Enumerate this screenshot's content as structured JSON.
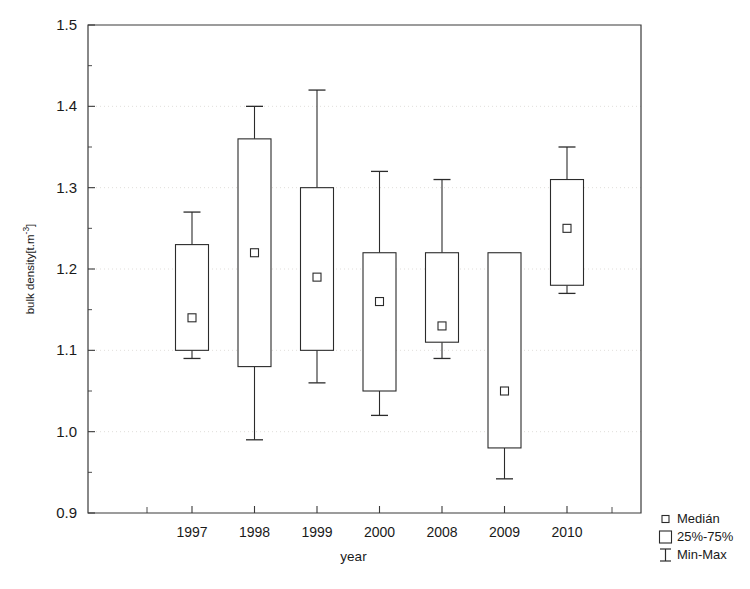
{
  "chart_data": {
    "type": "box",
    "title": "",
    "xlabel": "year",
    "ylabel": "bulk density[t.m-3]",
    "ylabel_base": "bulk density[t.m",
    "ylabel_sup": "-3",
    "ylabel_tail": "]",
    "categories": [
      "1997",
      "1998",
      "1999",
      "2000",
      "2008",
      "2009",
      "2010"
    ],
    "ylim": [
      0.9,
      1.5
    ],
    "ytick_labels": [
      "1.5",
      "1.4",
      "1.3",
      "1.2",
      "1.1",
      "1.0",
      "0.9"
    ],
    "ytick_values": [
      1.5,
      1.4,
      1.3,
      1.2,
      1.1,
      1.0,
      0.9
    ],
    "grid": true,
    "grid_axis": "y",
    "legend_position": "bottom-right-outside",
    "boxes": [
      {
        "category": "1997",
        "min": 1.09,
        "q1": 1.1,
        "median": 1.14,
        "q3": 1.23,
        "max": 1.27
      },
      {
        "category": "1998",
        "min": 0.99,
        "q1": 1.08,
        "median": 1.22,
        "q3": 1.36,
        "max": 1.4
      },
      {
        "category": "1999",
        "min": 1.06,
        "q1": 1.1,
        "median": 1.19,
        "q3": 1.3,
        "max": 1.42
      },
      {
        "category": "2000",
        "min": 1.02,
        "q1": 1.05,
        "median": 1.16,
        "q3": 1.22,
        "max": 1.32
      },
      {
        "category": "2008",
        "min": 1.09,
        "q1": 1.11,
        "median": 1.13,
        "q3": 1.22,
        "max": 1.31
      },
      {
        "category": "2009",
        "min": 0.942,
        "q1": 0.98,
        "median": 1.05,
        "q3": 1.22,
        "max": 1.22
      },
      {
        "category": "2010",
        "min": 1.17,
        "q1": 1.18,
        "median": 1.25,
        "q3": 1.31,
        "max": 1.35
      }
    ],
    "legend": [
      {
        "glyph": "square-small",
        "label": "Medián"
      },
      {
        "glyph": "square-large",
        "label": "25%-75%"
      },
      {
        "glyph": "i-bar",
        "label": "Min-Max"
      }
    ],
    "colors": {
      "axis": "#3a3a3a",
      "grid": "#d9d6d2",
      "box_stroke": "#2b2b2b",
      "box_fill": "#ffffff",
      "background": "#ffffff"
    }
  }
}
